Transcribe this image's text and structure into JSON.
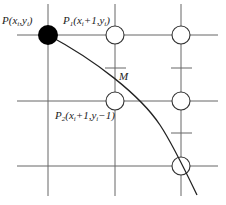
{
  "labels": {
    "p": {
      "main": "P",
      "open": "(",
      "x": "x",
      "xs": "i",
      "comma": ",",
      "y": "y",
      "ys": "i",
      "close": ")"
    },
    "p1": {
      "main": "P",
      "sub": "1",
      "open": "(",
      "x": "x",
      "xs": "i",
      "plus": "+1,",
      "y": "y",
      "ys": "i",
      "close": ")"
    },
    "p2": {
      "main": "P",
      "sub": "2",
      "open": "(",
      "x": "x",
      "xs": "i",
      "plus": "+1,",
      "y": "y",
      "ys": "i",
      "minus": "−1)"
    },
    "m": "M"
  },
  "colors": {
    "line": "#555555",
    "curve": "#222222",
    "fill": "#000000"
  }
}
